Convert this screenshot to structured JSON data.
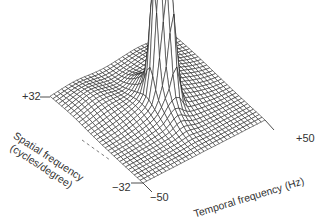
{
  "chart_data": {
    "type": "surface3d",
    "title": "",
    "xlabel": "Temporal frequency (Hz)",
    "ylabel": "Spatial frequency (cycles/degree)",
    "zlabel": "",
    "xlim": [
      -50,
      50
    ],
    "ylim": [
      -32,
      32
    ],
    "x_ticks": [
      "-50",
      "+50"
    ],
    "y_ticks": [
      "+32",
      "-32"
    ],
    "grid_resolution": [
      33,
      33
    ],
    "surface_description": "Wireframe mesh with a sharp central peak near temporal 0 Hz, spatial 0 cycles/degree; a secondary peak immediately adjacent; ridge extending along spatial axis near temporal 0; flat near-zero plateau elsewhere with shaded trough folds on either side of the peak",
    "peaks": [
      {
        "temporal_hz": 0,
        "spatial_cpd": 0,
        "relative_height": 1.0
      },
      {
        "temporal_hz": 6,
        "spatial_cpd": -4,
        "relative_height": 0.8
      }
    ],
    "line_color": "#1a1a1a",
    "background": "#ffffff"
  },
  "labels": {
    "spatial_top": "+32",
    "spatial_bottom": "−32",
    "temporal_left": "−50",
    "temporal_right": "+50",
    "spatial_axis_line1": "Spatial frequency",
    "spatial_axis_line2": "(cycles/degree)",
    "temporal_axis": "Temporal frequency (Hz)"
  }
}
